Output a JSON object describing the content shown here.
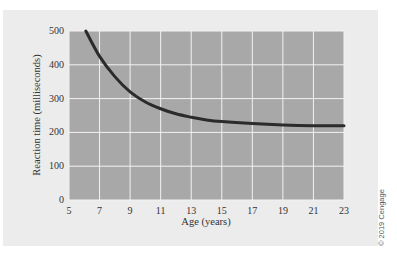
{
  "chart_data": {
    "type": "line",
    "title": "",
    "xlabel": "Age (years)",
    "ylabel": "Reaction time (milliseconds)",
    "xlim": [
      5,
      23
    ],
    "ylim": [
      0,
      500
    ],
    "x_ticks": [
      5,
      7,
      9,
      11,
      13,
      15,
      17,
      19,
      21,
      23
    ],
    "y_ticks": [
      0,
      100,
      200,
      300,
      400,
      500
    ],
    "grid": true,
    "legend": null,
    "series": [
      {
        "name": "Reaction time",
        "x": [
          6.1,
          7,
          8,
          9,
          10,
          11,
          12,
          13,
          14,
          15,
          17,
          19,
          21,
          23
        ],
        "y": [
          500,
          425,
          365,
          320,
          290,
          270,
          255,
          245,
          237,
          232,
          226,
          222,
          220,
          220
        ]
      }
    ]
  },
  "colors": {
    "background": "#ffffff",
    "card": "#ececec",
    "plot_area": "#a8a8a8",
    "grid": "#f2f2f2",
    "line": "#2b2b2b"
  },
  "credit": "© 2019 Cengage"
}
